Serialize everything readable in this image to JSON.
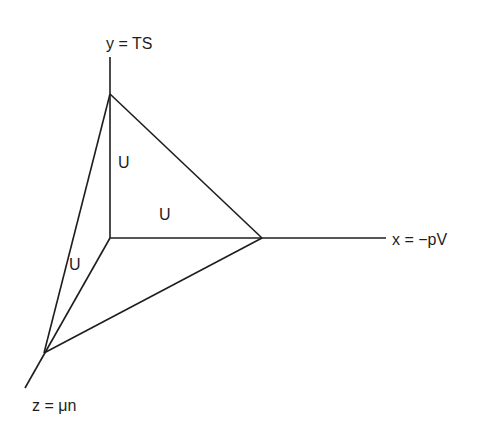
{
  "axes": {
    "y_label": "y = TS",
    "x_label": "x = −pV",
    "z_label": "z = μn"
  },
  "faces": {
    "face_xy": "U",
    "face_yz": "U",
    "face_xz": "U"
  },
  "colors": {
    "line": "#1e1e1e",
    "background": "#ffffff"
  }
}
